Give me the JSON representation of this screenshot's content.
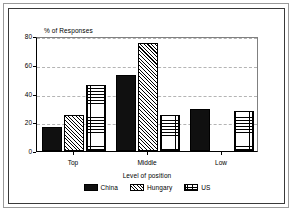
{
  "chart_data": {
    "type": "bar",
    "title": "",
    "xlabel": "Level of position",
    "ylabel": "% of Responses",
    "categories": [
      "Top",
      "Middle",
      "Low"
    ],
    "series": [
      {
        "name": "China",
        "values": [
          17,
          53,
          29
        ],
        "pattern": "solid-black"
      },
      {
        "name": "Hungary",
        "values": [
          25,
          75,
          0
        ],
        "pattern": "diagonal-hatch"
      },
      {
        "name": "US",
        "values": [
          46,
          25,
          28
        ],
        "pattern": "cross-hatch"
      }
    ],
    "ylim": [
      0,
      80
    ],
    "yticks": [
      0,
      20,
      40,
      60,
      80
    ],
    "ytick_labels": [
      "0",
      "20",
      "40",
      "60",
      "80"
    ],
    "grid": true,
    "grid_axis": "y",
    "legend_position": "bottom",
    "colors": {
      "axis": "#000000",
      "grid": "#b4b4b4",
      "bar_outline": "#000000",
      "background": "#ffffff"
    }
  },
  "legend": {
    "entries": [
      {
        "label": "China"
      },
      {
        "label": "Hungary"
      },
      {
        "label": "US"
      }
    ]
  }
}
